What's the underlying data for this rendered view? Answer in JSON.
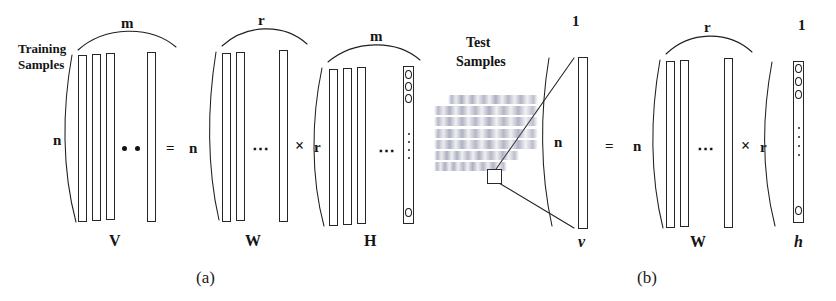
{
  "figure": {
    "caption_a": "(a)",
    "caption_b": "(b)",
    "panels": [
      {
        "id": "a",
        "annotation": "Training\nSamples",
        "annotation_line1": "Training",
        "annotation_line2": "Samples",
        "equation_symbols": {
          "equals": "=",
          "times": "×"
        },
        "matrices": [
          {
            "name": "V",
            "bottom_label": "V",
            "top_dim": "m",
            "left_dim": "n",
            "columns_drawn": 3,
            "trailing_columns": 1,
            "ellipsis": "•  •",
            "style": "bold-upright"
          },
          {
            "name": "W",
            "bottom_label": "W",
            "top_dim": "r",
            "left_dim": "n",
            "columns_drawn": 2,
            "trailing_columns": 1,
            "ellipsis": "⋯",
            "style": "bold-upright"
          },
          {
            "name": "H",
            "bottom_label": "H",
            "top_dim": "m",
            "left_dim": "r",
            "columns_drawn": 3,
            "trailing_columns": 1,
            "ellipsis": "⋯",
            "style": "bold-upright",
            "encoding_column": true,
            "encoding_circles_top": 3,
            "encoding_circles_bottom": 1
          }
        ]
      },
      {
        "id": "b",
        "annotation_line1": "Test",
        "annotation_line2": "Samples",
        "body_text_note": "blurred paragraph of body text (illegible in source scan)",
        "body_text_lines": 7,
        "equation_symbols": {
          "equals": "=",
          "times": "×"
        },
        "matrices": [
          {
            "name": "v",
            "bottom_label": "v",
            "top_dim": "1",
            "left_dim": "n",
            "columns_drawn": 1,
            "trailing_columns": 0,
            "ellipsis": "",
            "style": "bold-italic"
          },
          {
            "name": "W",
            "bottom_label": "W",
            "top_dim": "r",
            "left_dim": "n",
            "columns_drawn": 2,
            "trailing_columns": 1,
            "ellipsis": "⋯",
            "style": "bold-upright"
          },
          {
            "name": "h",
            "bottom_label": "h",
            "top_dim": "1",
            "left_dim": "r",
            "columns_drawn": 1,
            "trailing_columns": 0,
            "ellipsis": "",
            "style": "bold-italic",
            "encoding_column": true,
            "encoding_circles_top": 3,
            "encoding_circles_bottom": 1
          }
        ]
      }
    ]
  },
  "labels": {
    "a_training_1": "Training",
    "a_training_2": "Samples",
    "a_m_top_V": "m",
    "a_n_left_V": "n",
    "a_V": "V",
    "a_eq": "=",
    "a_n_mid": "n",
    "a_r_top_W": "r",
    "a_W": "W",
    "a_times": "×",
    "a_r_mid": "r",
    "a_m_top_H": "m",
    "a_H": "H",
    "a_caption": "(a)",
    "b_test_1": "Test",
    "b_test_2": "Samples",
    "b_one_top_v": "1",
    "b_n_left_v": "n",
    "b_v": "v",
    "b_eq": "=",
    "b_n_mid": "n",
    "b_r_top_W": "r",
    "b_W": "W",
    "b_times": "×",
    "b_r_mid": "r",
    "b_one_top_h": "1",
    "b_h": "h",
    "b_caption": "(b)"
  },
  "colors": {
    "background": "#ffffff",
    "ink": "#141414",
    "bar_stroke": "#262626",
    "blur_text": "#6e7391"
  }
}
